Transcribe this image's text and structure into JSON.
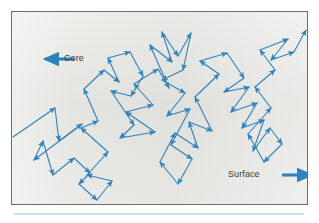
{
  "figure": {
    "caption_labels": {
      "core": "Core",
      "surface": "Surface"
    },
    "colors": {
      "path": "#2e82bd",
      "arrow": "#2e82bd",
      "panel_background": "#e6e6e2",
      "panel_border": "#6d6d6a",
      "label_text": "#3a3a38",
      "bottom_rule": "#cfe0ec",
      "page_background": "#ffffff"
    },
    "direction_markers": [
      {
        "name": "core-direction-arrow",
        "label": "Core",
        "points": "left",
        "x1": 62,
        "y1": 47,
        "x2": 33,
        "y2": 47
      },
      {
        "name": "surface-direction-arrow",
        "label": "Surface",
        "points": "right",
        "x1": 270,
        "y1": 163,
        "x2": 299,
        "y2": 163
      }
    ],
    "walk_path": {
      "description": "random-walk photon trajectory from core to surface",
      "entry_point": [
        1,
        125
      ],
      "exit_point": [
        294,
        18
      ],
      "vertices": [
        [
          1,
          125
        ],
        [
          43,
          96
        ],
        [
          47,
          129
        ],
        [
          70,
          112
        ],
        [
          22,
          148
        ],
        [
          31,
          129
        ],
        [
          41,
          163
        ],
        [
          62,
          146
        ],
        [
          78,
          161
        ],
        [
          67,
          172
        ],
        [
          85,
          188
        ],
        [
          100,
          169
        ],
        [
          75,
          163
        ],
        [
          96,
          140
        ],
        [
          69,
          116
        ],
        [
          86,
          109
        ],
        [
          72,
          77
        ],
        [
          92,
          58
        ],
        [
          107,
          70
        ],
        [
          96,
          46
        ],
        [
          118,
          40
        ],
        [
          131,
          64
        ],
        [
          119,
          84
        ],
        [
          99,
          79
        ],
        [
          122,
          113
        ],
        [
          108,
          126
        ],
        [
          143,
          120
        ],
        [
          114,
          100
        ],
        [
          141,
          93
        ],
        [
          122,
          72
        ],
        [
          146,
          57
        ],
        [
          157,
          76
        ],
        [
          138,
          33
        ],
        [
          160,
          50
        ],
        [
          150,
          20
        ],
        [
          166,
          44
        ],
        [
          179,
          21
        ],
        [
          171,
          58
        ],
        [
          150,
          68
        ],
        [
          173,
          81
        ],
        [
          155,
          104
        ],
        [
          178,
          97
        ],
        [
          159,
          133
        ],
        [
          180,
          147
        ],
        [
          166,
          172
        ],
        [
          148,
          150
        ],
        [
          163,
          121
        ],
        [
          186,
          136
        ],
        [
          177,
          110
        ],
        [
          200,
          119
        ],
        [
          183,
          85
        ],
        [
          207,
          62
        ],
        [
          188,
          49
        ],
        [
          215,
          41
        ],
        [
          232,
          66
        ],
        [
          212,
          80
        ],
        [
          237,
          75
        ],
        [
          219,
          100
        ],
        [
          245,
          91
        ],
        [
          230,
          116
        ],
        [
          252,
          108
        ],
        [
          241,
          139
        ],
        [
          258,
          116
        ],
        [
          270,
          132
        ],
        [
          252,
          150
        ],
        [
          236,
          122
        ],
        [
          259,
          96
        ],
        [
          243,
          75
        ],
        [
          263,
          58
        ],
        [
          248,
          38
        ],
        [
          276,
          27
        ],
        [
          259,
          48
        ],
        [
          282,
          40
        ],
        [
          294,
          18
        ]
      ]
    }
  }
}
